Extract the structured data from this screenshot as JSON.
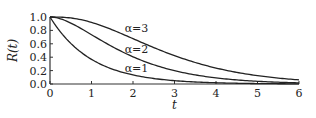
{
  "chart_data": {
    "type": "line",
    "title": "",
    "xlabel": "t",
    "ylabel": "R(t)",
    "xlim": [
      0,
      6
    ],
    "ylim": [
      0,
      1.0
    ],
    "x_ticks": [
      "0",
      "1",
      "2",
      "3",
      "4",
      "5",
      "6"
    ],
    "y_ticks": [
      "0.0",
      "0.2",
      "0.4",
      "0.6",
      "0.8",
      "1.0"
    ],
    "grid": false,
    "legend": "inline labels",
    "x": [
      0,
      0.5,
      1,
      1.5,
      2,
      2.5,
      3,
      3.5,
      4,
      4.5,
      5,
      5.5,
      6
    ],
    "series": [
      {
        "name": "α=1",
        "values": [
          1.0,
          0.61,
          0.37,
          0.22,
          0.14,
          0.08,
          0.05,
          0.03,
          0.02,
          0.01,
          0.01,
          0.0,
          0.0
        ]
      },
      {
        "name": "α=2",
        "values": [
          1.0,
          0.91,
          0.74,
          0.56,
          0.41,
          0.29,
          0.2,
          0.14,
          0.09,
          0.06,
          0.04,
          0.03,
          0.02
        ]
      },
      {
        "name": "α=3",
        "values": [
          1.0,
          0.99,
          0.92,
          0.81,
          0.68,
          0.54,
          0.42,
          0.32,
          0.24,
          0.17,
          0.12,
          0.09,
          0.06
        ]
      }
    ],
    "annotations": [
      {
        "text": "α=3",
        "x": 1.8,
        "y": 0.83
      },
      {
        "text": "α=2",
        "x": 1.8,
        "y": 0.52
      },
      {
        "text": "α=1",
        "x": 1.8,
        "y": 0.24
      }
    ]
  }
}
